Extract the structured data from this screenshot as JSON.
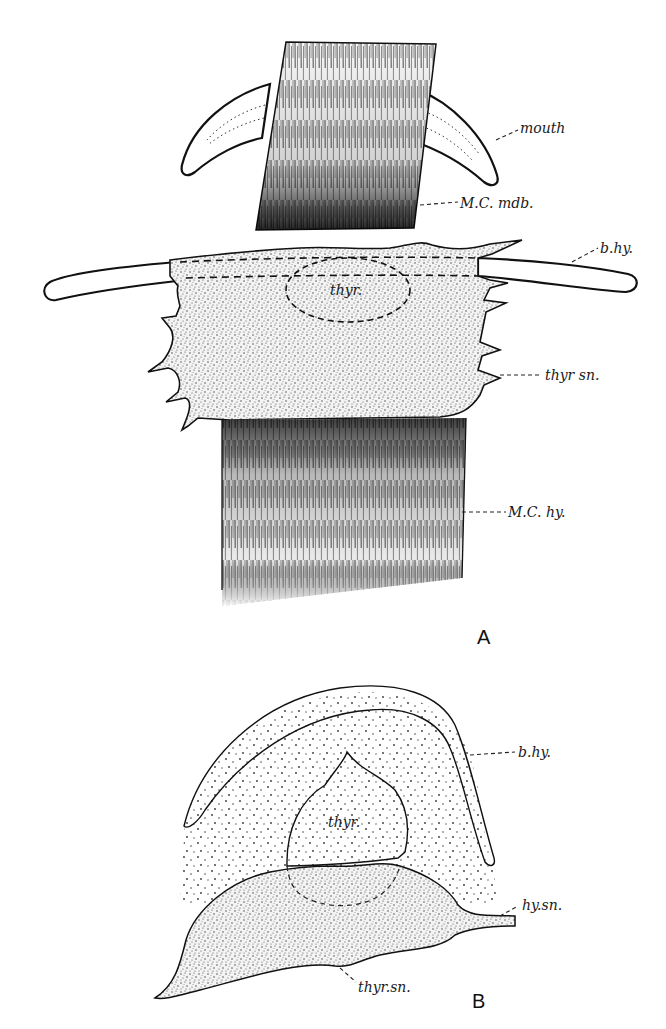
{
  "figure": {
    "panels": [
      {
        "id": "A",
        "label": "A",
        "annotations": [
          {
            "key": "mouth",
            "text": "mouth"
          },
          {
            "key": "mc_mdb",
            "text": "M.C. mdb."
          },
          {
            "key": "b_hy",
            "text": "b.hy."
          },
          {
            "key": "thyr",
            "text": "thyr."
          },
          {
            "key": "thyr_sn",
            "text": "thyr sn."
          },
          {
            "key": "mc_hy",
            "text": "M.C. hy."
          }
        ]
      },
      {
        "id": "B",
        "label": "B",
        "annotations": [
          {
            "key": "b_hy",
            "text": "b.hy."
          },
          {
            "key": "thyr",
            "text": "thyr."
          },
          {
            "key": "hy_sn",
            "text": "hy.sn."
          },
          {
            "key": "thyr_sn",
            "text": "thyr.sn."
          }
        ]
      }
    ]
  },
  "colors": {
    "ink": "#111111",
    "paper": "#ffffff"
  }
}
